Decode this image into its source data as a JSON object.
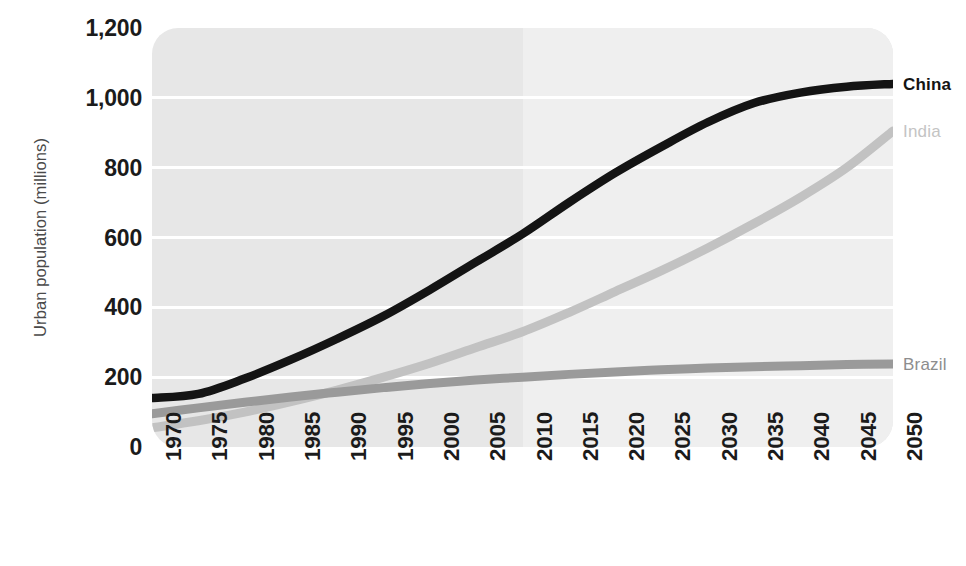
{
  "chart_data": {
    "type": "line",
    "title": "",
    "xlabel": "",
    "ylabel": "Urban population (millions)",
    "xlim": [
      1970,
      2050
    ],
    "ylim": [
      0,
      1200
    ],
    "grid": true,
    "legend_position": "right-of-plot-at-line-end",
    "x_tick_labels": [
      "1970",
      "1975",
      "1980",
      "1985",
      "1990",
      "1995",
      "2000",
      "2005",
      "2010",
      "2015",
      "2020",
      "2025",
      "2030",
      "2035",
      "2040",
      "2045",
      "2050"
    ],
    "y_tick_labels": [
      "1,200",
      "1,000",
      "800",
      "600",
      "400",
      "200",
      "0"
    ],
    "y_tick_values": [
      1200,
      1000,
      800,
      600,
      400,
      200,
      0
    ],
    "x": [
      1970,
      1975,
      1980,
      1985,
      1990,
      1995,
      2000,
      2005,
      2010,
      2015,
      2020,
      2025,
      2030,
      2035,
      2040,
      2045,
      2050
    ],
    "series": [
      {
        "name": "China",
        "color": "#141414",
        "values": [
          140,
          152,
          196,
          250,
          310,
          375,
          450,
          530,
          610,
          700,
          785,
          860,
          930,
          985,
          1015,
          1032,
          1040
        ]
      },
      {
        "name": "India",
        "color": "#c2c2c2",
        "values": [
          55,
          75,
          100,
          130,
          163,
          200,
          240,
          285,
          330,
          385,
          445,
          505,
          570,
          640,
          715,
          800,
          905
        ]
      },
      {
        "name": "Brazil",
        "color": "#9a9a9a",
        "values": [
          95,
          112,
          128,
          143,
          157,
          170,
          182,
          192,
          200,
          208,
          215,
          221,
          226,
          230,
          233,
          236,
          238
        ]
      }
    ],
    "annotations": {
      "projection_starts": 2010,
      "historical_band_color": "#e7e7e7",
      "projection_band_color": "#efefef",
      "gridline_color": "#ffffff"
    }
  },
  "axis": {
    "y_title": "Urban population (millions)"
  },
  "legend": {
    "items": [
      {
        "label": "China"
      },
      {
        "label": "India"
      },
      {
        "label": "Brazil"
      }
    ]
  }
}
